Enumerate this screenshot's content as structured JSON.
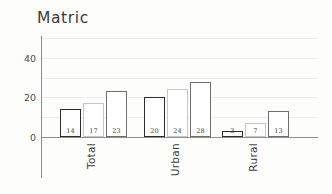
{
  "chart_data": {
    "type": "bar",
    "title": "Matric",
    "xlabel": "",
    "ylabel": "",
    "categories": [
      "Total",
      "Urban",
      "Rural"
    ],
    "series": [
      {
        "name": "series-1",
        "values": [
          14,
          20,
          3
        ],
        "outline_color": "#2c2c2c",
        "fill_color": "#ffffff"
      },
      {
        "name": "series-2",
        "values": [
          17,
          24,
          7
        ],
        "outline_color": "#c6c6c6",
        "fill_color": "#ffffff"
      },
      {
        "name": "series-3",
        "values": [
          23,
          28,
          13
        ],
        "outline_color": "#6e6e6e",
        "fill_color": "#ffffff"
      }
    ],
    "ylim": [
      0,
      50
    ],
    "y_ticks": [
      0,
      20,
      40
    ],
    "y_tick_labels": [
      "0",
      "20",
      "40"
    ],
    "gridlines": [
      10,
      20,
      30,
      40,
      50
    ],
    "grid": true,
    "legend": "none",
    "data_labels": {
      "Total": [
        "14",
        "17",
        "23"
      ],
      "Urban": [
        "20",
        "24",
        "28"
      ],
      "Rural": [
        "3",
        "7",
        "13"
      ]
    }
  },
  "colors": {
    "background": "#fdfdfc",
    "grid": "#ececec",
    "axis": "#8f8f8f",
    "title_text": "#3b3b3b",
    "tick_text": "#4a4a4a",
    "label_text": "#3d3d3d"
  }
}
